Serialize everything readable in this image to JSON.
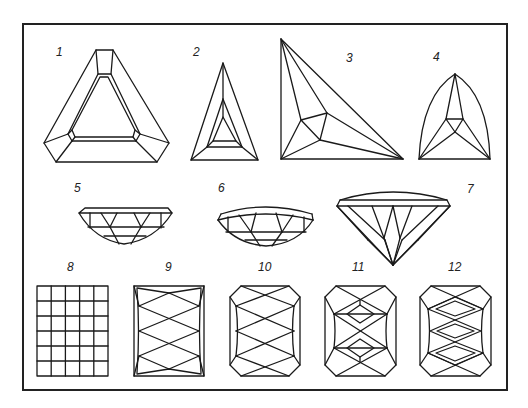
{
  "page": {
    "header_fragment": "",
    "frame_color": "#222222",
    "line_color": "#1a1a1a"
  },
  "figures": [
    {
      "label": "1",
      "shape": "triangular step cut (trilliant with truncated corners)"
    },
    {
      "label": "2",
      "shape": "elongated triangle step cut"
    },
    {
      "label": "3",
      "shape": "irregular (scalene) triangle cut"
    },
    {
      "label": "4",
      "shape": "curved triangle (trillion) cut"
    },
    {
      "label": "5",
      "shape": "side profile - pavilion, flat crown"
    },
    {
      "label": "6",
      "shape": "side profile - pavilion, domed crown"
    },
    {
      "label": "7",
      "shape": "side profile - brilliant with domed crown"
    },
    {
      "label": "8",
      "shape": "grid / checkerboard rectangle (5 x 6)"
    },
    {
      "label": "9",
      "shape": "rectangular scissors cut"
    },
    {
      "label": "10",
      "shape": "octagonal scissors cut"
    },
    {
      "label": "11",
      "shape": "octagonal cut with double lozenge facets"
    },
    {
      "label": "12",
      "shape": "octagonal cut with triple lozenge facets"
    }
  ]
}
